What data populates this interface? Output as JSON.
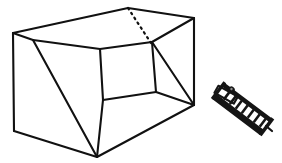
{
  "figure": {
    "title": "Open box line drawing with small dark rack object",
    "background_color": "#ffffff",
    "ink_color": "#111111",
    "canvas": {
      "width": 282,
      "height": 163
    },
    "objects": [
      {
        "name": "open-box",
        "label": "Open cardboard box, perspective line drawing",
        "stroke_color": "#111111",
        "stroke_width": 2.1,
        "hidden_edge_style": "dotted",
        "vertices": {
          "outer_top_left": [
            33,
            40
          ],
          "outer_top_back": [
            128,
            8
          ],
          "outer_top_right": [
            194,
            18
          ],
          "outer_bottom_left": [
            14,
            131
          ],
          "outer_bottom_front": [
            97,
            157
          ],
          "outer_bottom_right": [
            194,
            105
          ],
          "outer_left_upper": [
            13,
            33
          ],
          "inner_top_left": [
            100,
            49
          ],
          "inner_top_right": [
            152,
            42
          ],
          "inner_bottom_left": [
            103,
            100
          ],
          "inner_bottom_right": [
            156,
            92
          ]
        }
      },
      {
        "name": "dark-rack",
        "label": "Small dark ladder-like rack, tilted diagonally",
        "fill_color": "#151515",
        "rung_count": 7,
        "bounds": [
          212,
          86,
          60,
          46
        ]
      }
    ]
  }
}
